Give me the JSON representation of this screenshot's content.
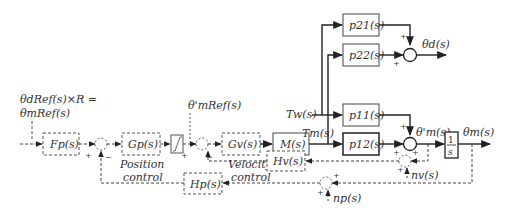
{
  "diagram": {
    "type": "control-block-diagram",
    "input_label_line1": "θdRef(s)×R =",
    "input_label_line2": "θmRef(s)",
    "blocks": {
      "Fp": "Fp(s)",
      "Gp": "Gp(s)",
      "Gv": "Gv(s)",
      "M": "M(s)",
      "p21": "p21(s)",
      "p22": "p22(s)",
      "p11": "p11(s)",
      "p12": "p12(s)",
      "integrator_num": "1",
      "integrator_den": "s",
      "Hv": "Hv(s)",
      "Hp": "Hp(s)"
    },
    "signals": {
      "theta_prime_mRef": "θ'mRef(s)",
      "Tw": "Tw(s)",
      "Tm": "Tm(s)",
      "theta_d": "θd(s)",
      "theta_prime_m": "θ'm(s)",
      "theta_m": "θm(s)",
      "nv": "nv(s)",
      "np": "np(s)"
    },
    "captions": {
      "position_line1": "Position",
      "position_line2": "control",
      "velocity_line1": "Velocity",
      "velocity_line2": "control"
    },
    "signs": {
      "plus": "+",
      "minus": "−"
    }
  }
}
